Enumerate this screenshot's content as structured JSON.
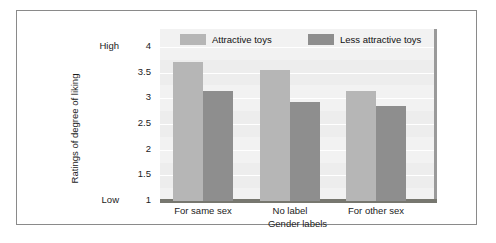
{
  "chart_data": {
    "type": "bar",
    "title": "",
    "xlabel": "Gender labels",
    "ylabel": "Ratings of degree of liking",
    "categories": [
      "For same sex",
      "No label",
      "For other sex"
    ],
    "series": [
      {
        "name": "Attractive toys",
        "color": "#b6b6b6",
        "values": [
          3.7,
          3.55,
          3.15
        ]
      },
      {
        "name": "Less attractive toys",
        "color": "#8e8e8e",
        "values": [
          3.15,
          2.93,
          2.85
        ]
      }
    ],
    "ylim": [
      1,
      4
    ],
    "yticks": [
      "1",
      "1.5",
      "2",
      "2.5",
      "3",
      "3.5",
      "4"
    ],
    "y_axis_low_label": "Low",
    "y_axis_high_label": "High",
    "grid": true,
    "legend_position": "top"
  },
  "legend": {
    "entries": [
      {
        "label": "Attractive toys"
      },
      {
        "label": "Less attractive toys"
      }
    ]
  }
}
